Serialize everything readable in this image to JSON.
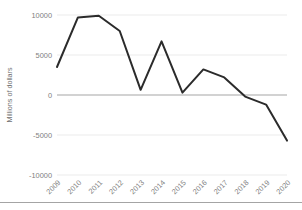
{
  "chart_data": {
    "type": "line",
    "title": "",
    "subtitle": "",
    "xlabel": "",
    "ylabel": "Millions of dollars",
    "categories": [
      "2009",
      "2010",
      "2011",
      "2012",
      "2013",
      "2014",
      "2015",
      "2016",
      "2017",
      "2018",
      "2019",
      "2020"
    ],
    "values": [
      3500,
      9700,
      9900,
      8000,
      650,
      6700,
      300,
      3200,
      2200,
      -200,
      -1200,
      -5700
    ],
    "series": [
      {
        "name": "Millions of dollars",
        "values": [
          3500,
          9700,
          9900,
          8000,
          650,
          6700,
          300,
          3200,
          2200,
          -200,
          -1200,
          -5700
        ]
      }
    ],
    "ylim": [
      -10000,
      10000
    ],
    "y_ticks": [
      10000,
      5000,
      0,
      -5000,
      -10000
    ],
    "y_tick_labels": [
      "10000",
      "5000",
      "0",
      "-5000",
      "-10000"
    ],
    "x_tick_labels": [
      "2009",
      "2010",
      "2011",
      "2012",
      "2013",
      "2014",
      "2015",
      "2016",
      "2017",
      "2018",
      "2019",
      "2020"
    ],
    "grid": true,
    "legend": false,
    "legend_position": "none",
    "line_color": "#2b2b2b",
    "grid_color": "#e2e2e2",
    "zero_line_color": "#a6a6a6",
    "tick_label_color": "#808080",
    "axis_title_color": "#707070",
    "background_color": "#ffffff",
    "x_tick_label_rotation": -45
  }
}
